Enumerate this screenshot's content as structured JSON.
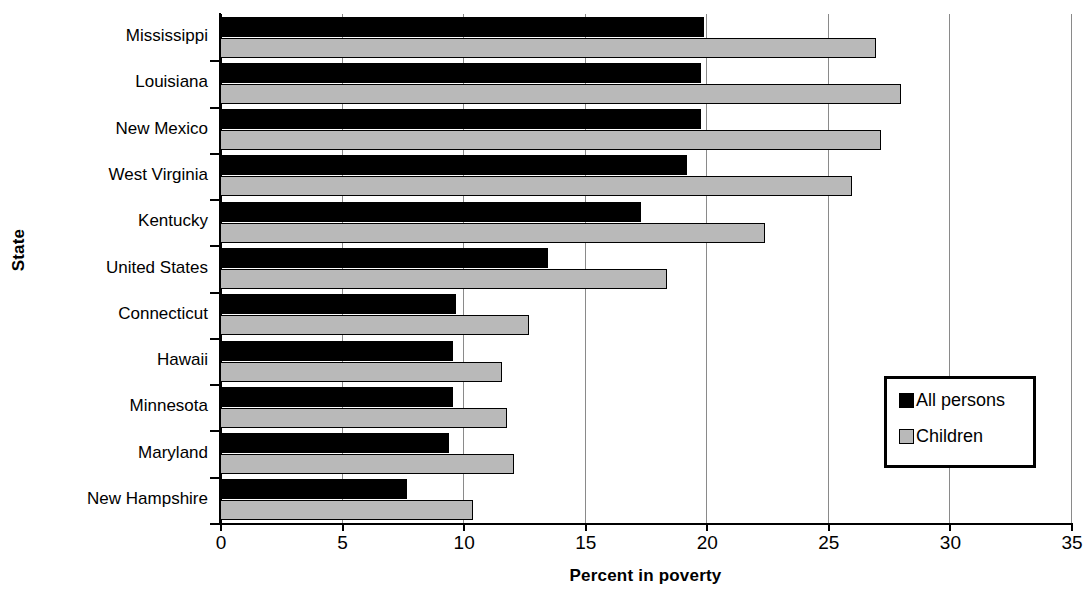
{
  "chart_data": {
    "type": "bar",
    "orientation": "horizontal",
    "title": "",
    "xlabel": "Percent in poverty",
    "ylabel": "State",
    "xlim": [
      0,
      35
    ],
    "xticks": [
      0,
      5,
      10,
      15,
      20,
      25,
      30,
      35
    ],
    "xtick_labels": [
      "0",
      "5",
      "10",
      "15",
      "20",
      "25",
      "30",
      "35"
    ],
    "grid": "vertical",
    "legend_position": "middle-right",
    "categories": [
      "Mississippi",
      "Louisiana",
      "New Mexico",
      "West Virginia",
      "Kentucky",
      "United States",
      "Connecticut",
      "Hawaii",
      "Minnesota",
      "Maryland",
      "New Hampshire"
    ],
    "series": [
      {
        "name": "All persons",
        "color": "#000000",
        "values": [
          19.9,
          19.8,
          19.8,
          19.2,
          17.3,
          13.5,
          9.7,
          9.6,
          9.6,
          9.4,
          7.7
        ]
      },
      {
        "name": "Children",
        "color": "#b9b9b9",
        "values": [
          27.0,
          28.0,
          27.2,
          26.0,
          22.4,
          18.4,
          12.7,
          11.6,
          11.8,
          12.1,
          10.4
        ]
      }
    ]
  },
  "legend": {
    "entries": [
      {
        "label": "All persons",
        "swatch": "black-square-icon"
      },
      {
        "label": "Children",
        "swatch": "gray-square-icon"
      }
    ]
  }
}
